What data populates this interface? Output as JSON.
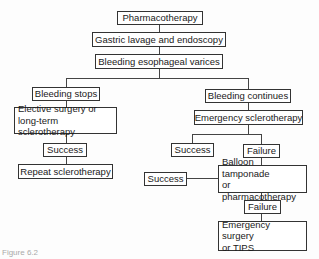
{
  "diagram": {
    "type": "flowchart",
    "nodes": {
      "pharmacotherapy": "Pharmacotherapy",
      "gastric_lavage": "Gastric lavage and endoscopy",
      "bleeding_varices": "Bleeding esophageal varices",
      "bleeding_stops": "Bleeding stops",
      "elective_line1": "Elective surgery or",
      "elective_line2": "long-term sclerotherapy",
      "success_left": "Success",
      "repeat_sclero": "Repeat sclerotherapy",
      "bleeding_continues": "Bleeding continues",
      "emergency_sclero": "Emergency sclerotherapy",
      "success_right": "Success",
      "failure_1": "Failure",
      "success_balloon": "Success",
      "balloon_line1": "Balloon tamponade",
      "balloon_line2": "or pharmacotherapy",
      "failure_2": "Failure",
      "emergency_surgery_line1": "Emergency surgery",
      "emergency_surgery_line2": "or TIPS"
    },
    "caption": "Figure 6.2"
  }
}
